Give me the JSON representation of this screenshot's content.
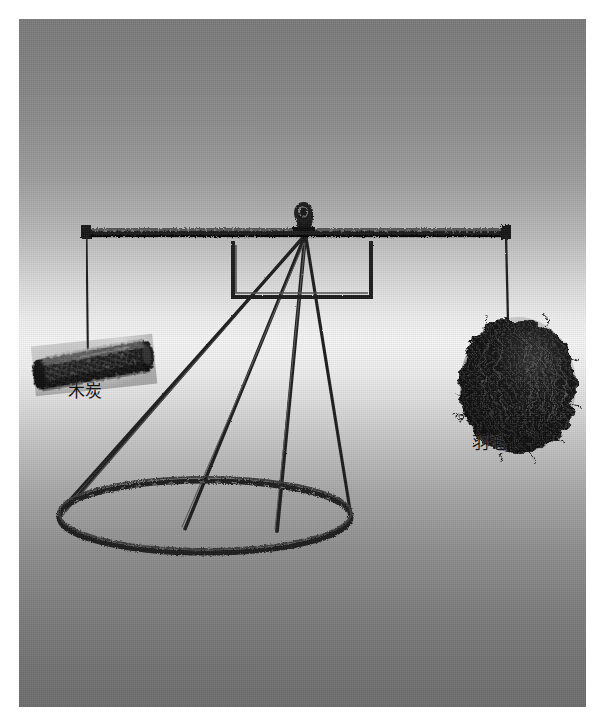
{
  "figure": {
    "type": "illustration",
    "medium": "halftone engraving on gray gradient background",
    "background": {
      "top_color": "#7b7b7b",
      "mid_color": "#f5f5f5",
      "bottom_color": "#6e6e6e",
      "panel_bounds": "19,19,567x688"
    },
    "ink_color": "#1a1a1a"
  },
  "labels": {
    "left": {
      "text": "木炭",
      "meaning": "charcoal",
      "position": "below-left-pan-object"
    },
    "right": {
      "text": "羽毛",
      "meaning": "feathers",
      "position": "below-right-pan-object"
    }
  },
  "apparatus": {
    "beam_label": "balance-beam",
    "fulcrum_label": "pivot-knot",
    "frame_label": "suspension-frame",
    "stand_label": "conical-tripod-stand",
    "base_label": "base-ring",
    "left_string_label": "left-suspension-cord",
    "right_string_label": "right-suspension-cord"
  },
  "objects": {
    "left": {
      "name": "charcoal-log",
      "shape": "cylinder",
      "tone": "#151515"
    },
    "right": {
      "name": "feather-mass",
      "shape": "rounded-blob",
      "tone": "#121212"
    }
  }
}
